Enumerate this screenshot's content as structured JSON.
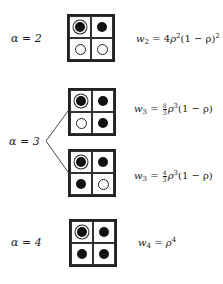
{
  "diagram": {
    "rows": [
      {
        "alpha_label": "α = 2",
        "configs": [
          {
            "cells": [
              "ringed",
              "filled",
              "empty",
              "empty"
            ],
            "weight": {
              "lhs": "w",
              "sub": "2",
              "coef": "4",
              "rho_exp": "2",
              "factor": "(1 − ρ)",
              "factor_exp": "2"
            }
          }
        ]
      },
      {
        "alpha_label": "α = 3",
        "configs": [
          {
            "cells": [
              "ringed",
              "filled",
              "empty",
              "filled"
            ],
            "weight": {
              "lhs": "w",
              "sub": "3",
              "frac_num": "8",
              "frac_den": "3",
              "rho_exp": "3",
              "factor": "(1 − ρ)"
            }
          },
          {
            "cells": [
              "ringed",
              "filled",
              "filled",
              "empty"
            ],
            "weight": {
              "lhs": "w",
              "sub": "3",
              "frac_num": "4",
              "frac_den": "3",
              "rho_exp": "3",
              "factor": "(1 − ρ)"
            }
          }
        ]
      },
      {
        "alpha_label": "α = 4",
        "configs": [
          {
            "cells": [
              "ringed",
              "filled",
              "filled",
              "filled"
            ],
            "weight": {
              "lhs": "w",
              "sub": "4",
              "rho_exp": "4"
            }
          }
        ]
      }
    ],
    "symbols": {
      "eq": "=",
      "rho": "ρ"
    },
    "legend_semantics": {
      "ringed": "reference site (occupied, circled)",
      "filled": "occupied site",
      "empty": "empty site"
    }
  }
}
